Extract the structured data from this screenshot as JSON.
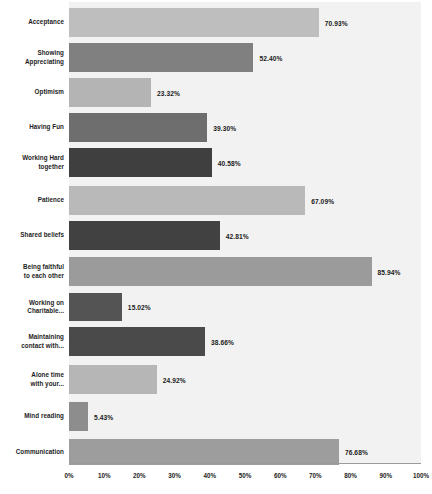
{
  "chart_data": {
    "type": "bar",
    "orientation": "horizontal",
    "title": "",
    "xlabel": "",
    "ylabel": "",
    "xlim": [
      0,
      100
    ],
    "grid": false,
    "legend": "none",
    "value_suffix": "%",
    "categories": [
      "Acceptance",
      "Showing Appreciating",
      "Optimism",
      "Having Fun",
      "Working Hard together",
      "Patience",
      "Shared beliefs",
      "Being faithful to each other",
      "Working on Charitable...",
      "Maintaining contact with...",
      "Alone time with your...",
      "Mind reading",
      "Communication"
    ],
    "values": [
      70.93,
      52.4,
      23.32,
      39.3,
      40.58,
      67.09,
      42.81,
      85.94,
      15.02,
      38.66,
      24.92,
      5.43,
      76.68
    ],
    "value_labels": [
      "70.93%",
      "52.40%",
      "23.32%",
      "39.30%",
      "40.58%",
      "67.09%",
      "42.81%",
      "85.94%",
      "15.02%",
      "38.66%",
      "24.92%",
      "5.43%",
      "76.68%"
    ],
    "bar_colors": [
      "#bebebe",
      "#808080",
      "#b4b4b4",
      "#6e6e6e",
      "#3f3f3f",
      "#b9b9b9",
      "#414141",
      "#9b9b9b",
      "#545454",
      "#4a4a4a",
      "#b6b6b6",
      "#8d8d8d",
      "#9d9d9d"
    ],
    "xticks": [
      0,
      10,
      20,
      30,
      40,
      50,
      60,
      70,
      80,
      90,
      100
    ],
    "xtick_labels": [
      "0%",
      "10%",
      "20%",
      "30%",
      "40%",
      "50%",
      "60%",
      "70%",
      "80%",
      "90%",
      "100%"
    ],
    "plot_background": "#f2f2f2",
    "axis_color": "#9a9a9a"
  },
  "bars": [
    {
      "label": "Acceptance",
      "label_lines": [
        "Acceptance"
      ],
      "value": 70.93,
      "value_label": "70.93%",
      "color": "#bebebe",
      "top": 6,
      "height": 29
    },
    {
      "label": "Showing Appreciating",
      "label_lines": [
        "Showing",
        "Appreciating"
      ],
      "value": 52.4,
      "value_label": "52.40%",
      "color": "#808080",
      "top": 41,
      "height": 29
    },
    {
      "label": "Optimism",
      "label_lines": [
        "Optimism"
      ],
      "value": 23.32,
      "value_label": "23.32%",
      "color": "#b4b4b4",
      "top": 76,
      "height": 29
    },
    {
      "label": "Having Fun",
      "label_lines": [
        "Having Fun"
      ],
      "value": 39.3,
      "value_label": "39.30%",
      "color": "#6e6e6e",
      "top": 111,
      "height": 29
    },
    {
      "label": "Working Hard together",
      "label_lines": [
        "Working Hard",
        "together"
      ],
      "value": 40.58,
      "value_label": "40.58%",
      "color": "#3f3f3f",
      "top": 146,
      "height": 29
    },
    {
      "label": "Patience",
      "label_lines": [
        "Patience"
      ],
      "value": 67.09,
      "value_label": "67.09%",
      "color": "#b9b9b9",
      "top": 184,
      "height": 29
    },
    {
      "label": "Shared beliefs",
      "label_lines": [
        "Shared beliefs"
      ],
      "value": 42.81,
      "value_label": "42.81%",
      "color": "#414141",
      "top": 219,
      "height": 29
    },
    {
      "label": "Being faithful to each other",
      "label_lines": [
        "Being faithful",
        "to each other"
      ],
      "value": 85.94,
      "value_label": "85.94%",
      "color": "#9b9b9b",
      "top": 255,
      "height": 29
    },
    {
      "label": "Working on Charitable...",
      "label_lines": [
        "Working on",
        "Charitable..."
      ],
      "value": 15.02,
      "value_label": "15.02%",
      "color": "#545454",
      "top": 291,
      "height": 28
    },
    {
      "label": "Maintaining contact with...",
      "label_lines": [
        "Maintaining",
        "contact with..."
      ],
      "value": 38.66,
      "value_label": "38.66%",
      "color": "#4a4a4a",
      "top": 325,
      "height": 29
    },
    {
      "label": "Alone time with your...",
      "label_lines": [
        "Alone time",
        "with your..."
      ],
      "value": 24.92,
      "value_label": "24.92%",
      "color": "#b6b6b6",
      "top": 363,
      "height": 29
    },
    {
      "label": "Mind reading",
      "label_lines": [
        "Mind reading"
      ],
      "value": 5.43,
      "value_label": "5.43%",
      "color": "#8d8d8d",
      "top": 400,
      "height": 29
    },
    {
      "label": "Communication",
      "label_lines": [
        "Communication"
      ],
      "value": 76.68,
      "value_label": "76.68%",
      "color": "#9d9d9d",
      "top": 437,
      "height": 26
    }
  ],
  "xticks": [
    {
      "label": "0%",
      "value": 0
    },
    {
      "label": "10%",
      "value": 10
    },
    {
      "label": "20%",
      "value": 20
    },
    {
      "label": "30%",
      "value": 30
    },
    {
      "label": "40%",
      "value": 40
    },
    {
      "label": "50%",
      "value": 50
    },
    {
      "label": "60%",
      "value": 60
    },
    {
      "label": "70%",
      "value": 70
    },
    {
      "label": "80%",
      "value": 80
    },
    {
      "label": "90%",
      "value": 90
    },
    {
      "label": "100%",
      "value": 100
    }
  ]
}
